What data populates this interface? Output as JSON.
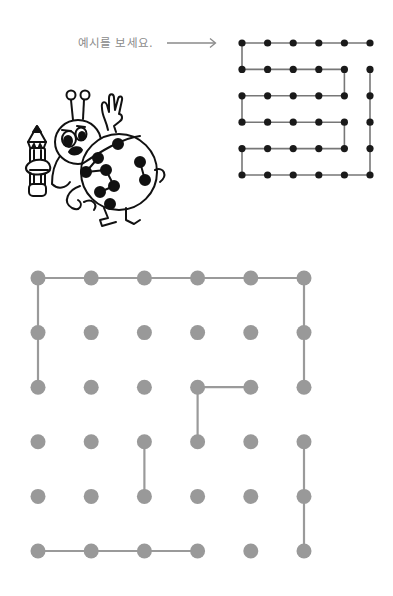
{
  "header": {
    "instruction_text": "예시를 보세요.",
    "arrow_icon": "right-arrow"
  },
  "colors": {
    "instruction_text": "#8a8a8a",
    "example_dot": "#1a1a1a",
    "example_line": "#777777",
    "puzzle_dot": "#999999",
    "puzzle_line": "#9a9a9a",
    "background": "#ffffff"
  },
  "example_grid": {
    "rows": 6,
    "cols": 6,
    "origin": [
      242,
      43
    ],
    "spacing": [
      25.6,
      26.4
    ],
    "path": [
      [
        5,
        0
      ],
      [
        4,
        0
      ],
      [
        3,
        0
      ],
      [
        2,
        0
      ],
      [
        1,
        0
      ],
      [
        0,
        0
      ],
      [
        0,
        1
      ],
      [
        1,
        1
      ],
      [
        2,
        1
      ],
      [
        3,
        1
      ],
      [
        4,
        1
      ],
      [
        4,
        2
      ],
      [
        3,
        2
      ],
      [
        2,
        2
      ],
      [
        1,
        2
      ],
      [
        0,
        2
      ],
      [
        0,
        3
      ],
      [
        1,
        3
      ],
      [
        2,
        3
      ],
      [
        3,
        3
      ],
      [
        4,
        3
      ],
      [
        4,
        4
      ],
      [
        3,
        4
      ],
      [
        2,
        4
      ],
      [
        1,
        4
      ],
      [
        0,
        4
      ],
      [
        0,
        5
      ],
      [
        1,
        5
      ],
      [
        2,
        5
      ],
      [
        3,
        5
      ],
      [
        4,
        5
      ],
      [
        5,
        5
      ],
      [
        5,
        4
      ],
      [
        5,
        3
      ],
      [
        5,
        2
      ],
      [
        5,
        1
      ]
    ]
  },
  "puzzle_grid": {
    "rows": 6,
    "cols": 6,
    "origin": [
      38,
      278
    ],
    "spacing": [
      53.2,
      54.6
    ],
    "segments": [
      [
        [
          0,
          2
        ],
        [
          0,
          1
        ]
      ],
      [
        [
          0,
          1
        ],
        [
          0,
          0
        ]
      ],
      [
        [
          0,
          0
        ],
        [
          1,
          0
        ]
      ],
      [
        [
          1,
          0
        ],
        [
          2,
          0
        ]
      ],
      [
        [
          2,
          0
        ],
        [
          3,
          0
        ]
      ],
      [
        [
          3,
          0
        ],
        [
          4,
          0
        ]
      ],
      [
        [
          4,
          0
        ],
        [
          5,
          0
        ]
      ],
      [
        [
          5,
          0
        ],
        [
          5,
          1
        ]
      ],
      [
        [
          5,
          1
        ],
        [
          5,
          2
        ]
      ],
      [
        [
          3,
          2
        ],
        [
          4,
          2
        ]
      ],
      [
        [
          3,
          2
        ],
        [
          3,
          3
        ]
      ],
      [
        [
          2,
          3
        ],
        [
          2,
          4
        ]
      ],
      [
        [
          5,
          3
        ],
        [
          5,
          4
        ]
      ],
      [
        [
          5,
          4
        ],
        [
          5,
          5
        ]
      ],
      [
        [
          0,
          5
        ],
        [
          1,
          5
        ]
      ],
      [
        [
          1,
          5
        ],
        [
          2,
          5
        ]
      ],
      [
        [
          2,
          5
        ],
        [
          3,
          5
        ]
      ]
    ]
  },
  "mascot": {
    "description": "ladybug-holding-pencil",
    "shell_dots": 9
  }
}
